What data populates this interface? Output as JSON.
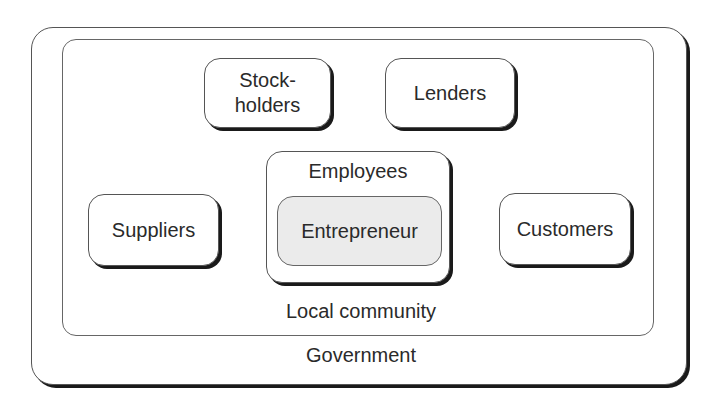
{
  "diagram": {
    "type": "nested-stakeholder-diagram",
    "outer_layer": {
      "label": "Government"
    },
    "inner_layer": {
      "label": "Local community"
    },
    "nodes": [
      {
        "id": "stockholders",
        "label_line1": "Stock-",
        "label_line2": "holders"
      },
      {
        "id": "lenders",
        "label": "Lenders"
      },
      {
        "id": "suppliers",
        "label": "Suppliers"
      },
      {
        "id": "customers",
        "label": "Customers"
      }
    ],
    "center": {
      "container_label": "Employees",
      "core_label": "Entrepreneur"
    },
    "colors": {
      "border": "#555555",
      "shadow": "#1a1a1a",
      "core_fill": "#ebebeb",
      "text": "#2a2a2a"
    }
  }
}
